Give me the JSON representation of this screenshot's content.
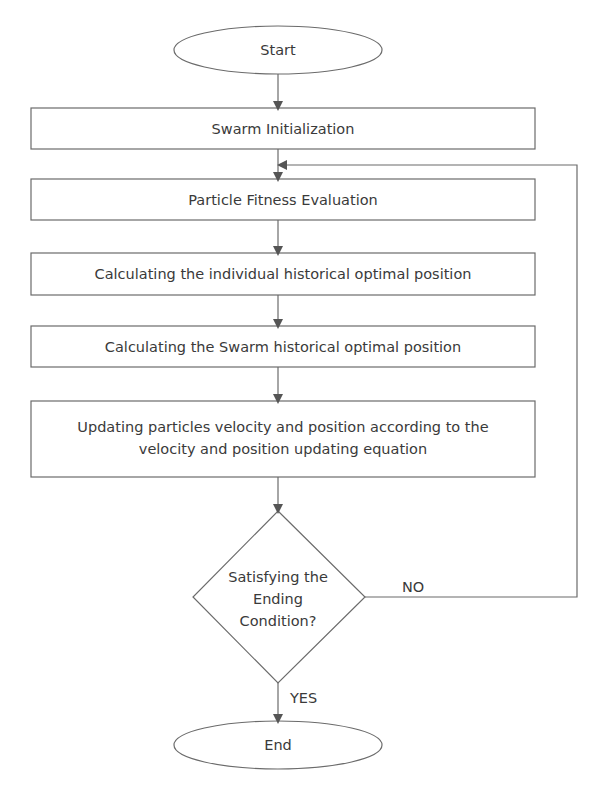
{
  "flowchart": {
    "colors": {
      "stroke": "#6b6b6b",
      "text": "#3a3a3a",
      "background": "#ffffff"
    },
    "start": {
      "label": "Start"
    },
    "steps": [
      {
        "label": "Swarm Initialization"
      },
      {
        "label": "Particle Fitness Evaluation"
      },
      {
        "label": "Calculating the individual historical optimal position"
      },
      {
        "label": "Calculating the Swarm historical optimal position"
      },
      {
        "label_line1": "Updating particles velocity and position according to the",
        "label_line2": "velocity and position updating equation"
      }
    ],
    "decision": {
      "line1": "Satisfying the",
      "line2": "Ending",
      "line3": "Condition?",
      "no_label": "NO",
      "yes_label": "YES"
    },
    "end": {
      "label": "End"
    }
  }
}
